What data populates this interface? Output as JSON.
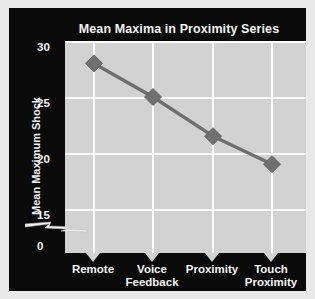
{
  "chart_data": {
    "type": "line",
    "title": "Mean Maxima in Proximity Series",
    "xlabel": "",
    "ylabel": "Mean Maximum Shock",
    "categories": [
      "Remote",
      "Voice Feedback",
      "Proximity",
      "Touch Proximity"
    ],
    "values": [
      28,
      25,
      21.5,
      19
    ],
    "yticks": [
      30,
      25,
      20,
      15,
      0
    ],
    "ylim": [
      15,
      30
    ],
    "axis_break": true,
    "grid": true,
    "legend": "none",
    "series": [
      {
        "name": "Mean Maximum Shock",
        "values": [
          28,
          25,
          21.5,
          19
        ]
      }
    ]
  },
  "chart": {
    "title": "Mean Maxima in Proximity Series",
    "y_axis_title": "Mean Maximum Shock",
    "y_tick_labels": [
      "30",
      "25",
      "20",
      "15",
      "0"
    ],
    "x_tick_labels": [
      {
        "line1": "Remote",
        "line2": ""
      },
      {
        "line1": "Voice",
        "line2": "Feedback"
      },
      {
        "line1": "Proximity",
        "line2": ""
      },
      {
        "line1": "Touch",
        "line2": "Proximity"
      }
    ]
  },
  "colors": {
    "panel_background": "#0a0a0a",
    "plot_background": "#d2d2d2",
    "gridline": "#fdfdfd",
    "series_line": "#6e6e6e",
    "marker_fill": "#707070",
    "text": "#f5f5f5",
    "figure_border": "#e9e9e9"
  }
}
